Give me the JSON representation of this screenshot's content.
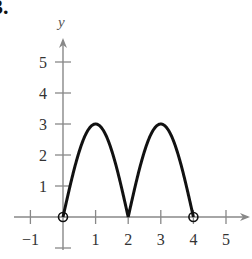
{
  "problem_number": "3.",
  "chart_data": {
    "type": "line",
    "title": "",
    "xlabel": "",
    "ylabel": "y",
    "x_ticks": [
      -1,
      1,
      2,
      3,
      4,
      5
    ],
    "y_ticks": [
      1,
      2,
      3,
      4,
      5
    ],
    "xlim": [
      -1.5,
      5.7
    ],
    "ylim": [
      -1,
      5.8
    ],
    "grid": false,
    "series": [
      {
        "name": "f(x)",
        "description": "Two arches of height 3: rises from (0,0) to peak (1,3), down to cusp (2,0), up to peak (3,3), down to (4,0)",
        "x": [
          0,
          0.25,
          0.5,
          0.75,
          1,
          1.25,
          1.5,
          1.75,
          2,
          2.25,
          2.5,
          2.75,
          3,
          3.25,
          3.5,
          3.75,
          4
        ],
        "y": [
          0,
          1.15,
          2.12,
          2.77,
          3,
          2.77,
          2.12,
          1.15,
          0,
          1.15,
          2.12,
          2.77,
          3,
          2.77,
          2.12,
          1.15,
          0
        ]
      }
    ],
    "open_points": [
      [
        0,
        0
      ],
      [
        4,
        0
      ]
    ],
    "peaks": [
      [
        1,
        3
      ],
      [
        3,
        3
      ]
    ],
    "cusp": [
      2,
      0
    ]
  }
}
